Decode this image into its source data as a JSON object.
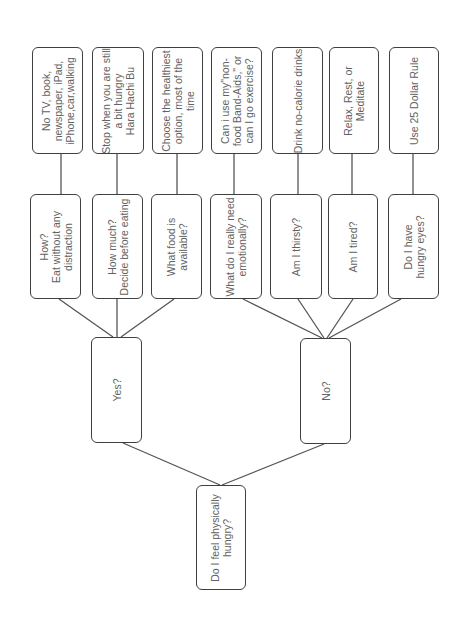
{
  "diagram": {
    "orientation": "rotated-90-ccw",
    "colors": {
      "border": "#3f3f3f",
      "text": "#626262",
      "line": "#555555",
      "background": "#ffffff"
    },
    "root": {
      "id": "root",
      "label": "Do I feel physically\nhungry?",
      "box": [
        196,
        485,
        50,
        105
      ]
    },
    "branches": [
      {
        "id": "yes",
        "label": "Yes?",
        "box": [
          91,
          337,
          51,
          106
        ]
      },
      {
        "id": "no",
        "label": "No?",
        "box": [
          300,
          338,
          51,
          106
        ]
      }
    ],
    "questions": [
      {
        "id": "q1",
        "parent": "yes",
        "label": "How?\nEat without any\ndistraction",
        "box": [
          30,
          194,
          51,
          105
        ]
      },
      {
        "id": "q2",
        "parent": "yes",
        "label": "How much?\nDecide before eating",
        "box": [
          92,
          194,
          51,
          105
        ]
      },
      {
        "id": "q3",
        "parent": "yes",
        "label": "What food is\navailable?",
        "box": [
          151,
          194,
          51,
          105
        ]
      },
      {
        "id": "q4",
        "parent": "no",
        "label": "What do I really need\nemotionally?",
        "box": [
          210,
          194,
          52,
          105
        ]
      },
      {
        "id": "q5",
        "parent": "no",
        "label": "Am I thirsty?",
        "box": [
          270,
          194,
          52,
          105
        ]
      },
      {
        "id": "q6",
        "parent": "no",
        "label": "Am I tired?",
        "box": [
          328,
          194,
          50,
          105
        ]
      },
      {
        "id": "q7",
        "parent": "no",
        "label": "Do I have\nhungry eyes?",
        "box": [
          388,
          194,
          51,
          105
        ]
      }
    ],
    "actions": [
      {
        "id": "a1",
        "parent": "q1",
        "label": "No TV, book,\nnewspaper, iPad,\niPhone,car,walking",
        "box": [
          32,
          47,
          51,
          107
        ]
      },
      {
        "id": "a2",
        "parent": "q2",
        "label": "Stop when you are still\na bit hungry\nHara Hachi Bu",
        "box": [
          92,
          47,
          52,
          107
        ]
      },
      {
        "id": "a3",
        "parent": "q3",
        "label": "Choose the healthiest\noption, most of the\ntime",
        "box": [
          152,
          47,
          51,
          107
        ]
      },
      {
        "id": "a4",
        "parent": "q4",
        "label": "Can i use my\"non-\nfood Band-Aids,\" or\ncan I go exercise?",
        "box": [
          211,
          47,
          51,
          107
        ]
      },
      {
        "id": "a5",
        "parent": "q5",
        "label": "Drink no-calorie drinks",
        "box": [
          272,
          47,
          51,
          107
        ]
      },
      {
        "id": "a6",
        "parent": "q6",
        "label": "Relax, Rest, or\nMeditate",
        "box": [
          329,
          47,
          50,
          107
        ]
      },
      {
        "id": "a7",
        "parent": "q7",
        "label": "Use 25 Dollar Rule",
        "box": [
          389,
          47,
          50,
          107
        ]
      }
    ],
    "edges": [
      {
        "from": "root",
        "to": "yes",
        "points": [
          220,
          485,
          123,
          443
        ]
      },
      {
        "from": "root",
        "to": "no",
        "points": [
          222,
          485,
          324,
          444
        ]
      },
      {
        "from": "yes",
        "to": "q1",
        "points": [
          113,
          337,
          59,
          299
        ]
      },
      {
        "from": "yes",
        "to": "q2",
        "points": [
          117,
          337,
          117,
          299
        ]
      },
      {
        "from": "yes",
        "to": "q3",
        "points": [
          121,
          337,
          174,
          299
        ]
      },
      {
        "from": "no",
        "to": "q4",
        "points": [
          322,
          338,
          243,
          299
        ]
      },
      {
        "from": "no",
        "to": "q5",
        "points": [
          324,
          338,
          298,
          299
        ]
      },
      {
        "from": "no",
        "to": "q6",
        "points": [
          327,
          338,
          353,
          299
        ]
      },
      {
        "from": "no",
        "to": "q7",
        "points": [
          329,
          338,
          401,
          299
        ]
      },
      {
        "from": "q1",
        "to": "a1",
        "points": [
          61,
          194,
          61,
          154
        ]
      },
      {
        "from": "q2",
        "to": "a2",
        "points": [
          117,
          194,
          117,
          154
        ]
      },
      {
        "from": "q3",
        "to": "a3",
        "points": [
          177,
          194,
          177,
          154
        ]
      },
      {
        "from": "q4",
        "to": "a4",
        "points": [
          234,
          194,
          234,
          154
        ]
      },
      {
        "from": "q5",
        "to": "a5",
        "points": [
          298,
          194,
          298,
          154
        ]
      },
      {
        "from": "q6",
        "to": "a6",
        "points": [
          352,
          194,
          352,
          154
        ]
      },
      {
        "from": "q7",
        "to": "a7",
        "points": [
          413,
          194,
          413,
          154
        ]
      }
    ]
  }
}
